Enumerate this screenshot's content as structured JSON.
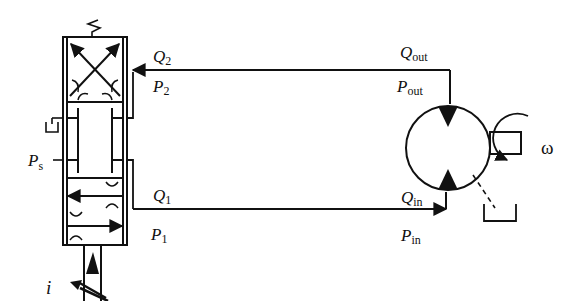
{
  "diagram": {
    "type": "hydraulic circuit: servo valve driving hydraulic motor",
    "colors": {
      "line": "#111111",
      "background": "#ffffff"
    },
    "labels": {
      "q2": {
        "main": "Q",
        "sub": "2"
      },
      "p2": {
        "main": "P",
        "sub": "2"
      },
      "q1": {
        "main": "Q",
        "sub": "1"
      },
      "p1": {
        "main": "P",
        "sub": "1"
      },
      "ps": {
        "main": "P",
        "sub": "s"
      },
      "qout": {
        "main": "Q",
        "sub": "out"
      },
      "pout": {
        "main": "P",
        "sub": "out"
      },
      "qin": {
        "main": "Q",
        "sub": "in"
      },
      "pin": {
        "main": "P",
        "sub": "in"
      },
      "omega": "ω",
      "current": "i"
    },
    "components": [
      "servo-valve (3-position, spring-centered, proportional solenoid)",
      "hydraulic-motor (bidirectional)",
      "tank-return-symbols",
      "rotating-shaft"
    ]
  }
}
